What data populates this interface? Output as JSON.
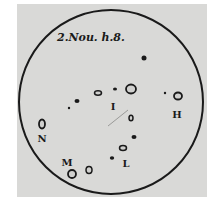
{
  "drawing": {
    "caption": "2.Nou. h.8.",
    "disk": {
      "cx": 111,
      "cy": 102,
      "r": 92,
      "stroke": "#1a1a1a"
    },
    "paper_color": "#d9d9d7",
    "labels": [
      {
        "id": "I",
        "text": "I",
        "x": 113,
        "y": 110
      },
      {
        "id": "H",
        "text": "H",
        "x": 177,
        "y": 118
      },
      {
        "id": "N",
        "text": "N",
        "x": 42,
        "y": 142
      },
      {
        "id": "M",
        "text": "M",
        "x": 67,
        "y": 166
      },
      {
        "id": "L",
        "text": "L",
        "x": 126,
        "y": 167
      }
    ],
    "spots": [
      {
        "cx": 144,
        "cy": 58,
        "rx": 2.5,
        "ry": 2.5,
        "type": "filled"
      },
      {
        "cx": 131,
        "cy": 89,
        "rx": 5,
        "ry": 4.5,
        "type": "ring"
      },
      {
        "cx": 115,
        "cy": 89,
        "rx": 2,
        "ry": 1.6,
        "type": "filled"
      },
      {
        "cx": 98,
        "cy": 93,
        "rx": 3.5,
        "ry": 2.2,
        "type": "ring-small"
      },
      {
        "cx": 77,
        "cy": 101,
        "rx": 2.5,
        "ry": 2,
        "type": "filled"
      },
      {
        "cx": 69,
        "cy": 108,
        "rx": 1.2,
        "ry": 1.2,
        "type": "filled"
      },
      {
        "cx": 165,
        "cy": 93,
        "rx": 1.2,
        "ry": 1.2,
        "type": "filled"
      },
      {
        "cx": 178,
        "cy": 96,
        "rx": 4,
        "ry": 3.5,
        "type": "ring"
      },
      {
        "cx": 131,
        "cy": 118,
        "rx": 2,
        "ry": 2.8,
        "type": "ring-small"
      },
      {
        "cx": 134,
        "cy": 137,
        "rx": 2.5,
        "ry": 2,
        "type": "filled"
      },
      {
        "cx": 123,
        "cy": 148,
        "rx": 3.5,
        "ry": 2.5,
        "type": "ring-small"
      },
      {
        "cx": 112,
        "cy": 158,
        "rx": 2.2,
        "ry": 1.8,
        "type": "filled"
      },
      {
        "cx": 89,
        "cy": 170,
        "rx": 3,
        "ry": 3.5,
        "type": "ring-small"
      },
      {
        "cx": 72,
        "cy": 174,
        "rx": 4,
        "ry": 4,
        "type": "ring"
      },
      {
        "cx": 42,
        "cy": 124,
        "rx": 3,
        "ry": 4.5,
        "type": "ring"
      }
    ]
  }
}
